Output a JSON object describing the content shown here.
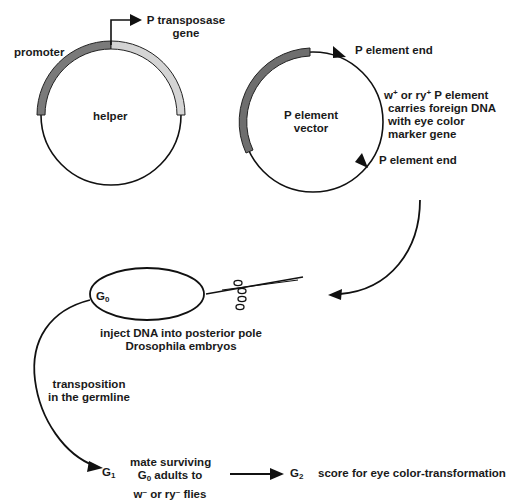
{
  "helper": {
    "name": "helper",
    "promoter_label": "promoter",
    "gene_label_line1": "P transposase",
    "gene_label_line2": "gene",
    "colors": {
      "promoter": "#7a7a7a",
      "gene": "#d4d4d4"
    }
  },
  "vector": {
    "name_line1": "P element",
    "name_line2": "vector",
    "end_top": "P element end",
    "end_bottom": "P element end",
    "desc_line1_a": "w",
    "desc_line1_sup1": "+",
    "desc_line1_b": " or ry",
    "desc_line1_sup2": "+",
    "desc_line1_c": " P element",
    "desc_line2": "carries foreign DNA",
    "desc_line3": "with eye color",
    "desc_line4": "marker gene",
    "colors": {
      "insert": "#6e6e6e"
    }
  },
  "injection": {
    "g0_label": "G",
    "g0_sub": "0",
    "caption_line1": "inject DNA into posterior pole",
    "caption_line2": "Drosophila embryos"
  },
  "germline": {
    "label_line1": "transposition",
    "label_line2": "in the germline"
  },
  "mating": {
    "g1_label": "G",
    "g1_sub": "1",
    "line1": "mate surviving",
    "line2_a": "G",
    "line2_sub": "0",
    "line2_b": " adults to",
    "line3_a": "w",
    "line3_sup1": "–",
    "line3_b": " or ry",
    "line3_sup2": "–",
    "line3_c": " flies"
  },
  "result": {
    "g2_label": "G",
    "g2_sub": "2",
    "score_text": "score for eye color-transformation"
  }
}
